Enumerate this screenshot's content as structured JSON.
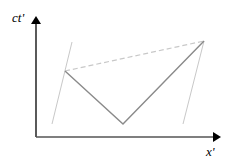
{
  "diagram": {
    "type": "spacetime-diagram",
    "axes": {
      "y_label": "ct'",
      "x_label": "x'"
    },
    "colors": {
      "axis": "#000000",
      "worldline": "#8a8a8a",
      "boundary": "#c8c8c8",
      "dashed": "#c8c8c8"
    },
    "elements": [
      {
        "name": "left-boundary-worldline",
        "from": [
          72,
          42
        ],
        "to": [
          52,
          124
        ]
      },
      {
        "name": "right-boundary-worldline",
        "from": [
          204,
          41
        ],
        "to": [
          183,
          124
        ]
      },
      {
        "name": "outgoing-light-path",
        "from": [
          65,
          71
        ],
        "to": [
          123,
          124
        ]
      },
      {
        "name": "returning-light-path",
        "from": [
          123,
          124
        ],
        "to": [
          204,
          41
        ]
      },
      {
        "name": "simultaneity-dashed-line",
        "from": [
          65,
          71
        ],
        "to": [
          204,
          41
        ]
      }
    ]
  }
}
